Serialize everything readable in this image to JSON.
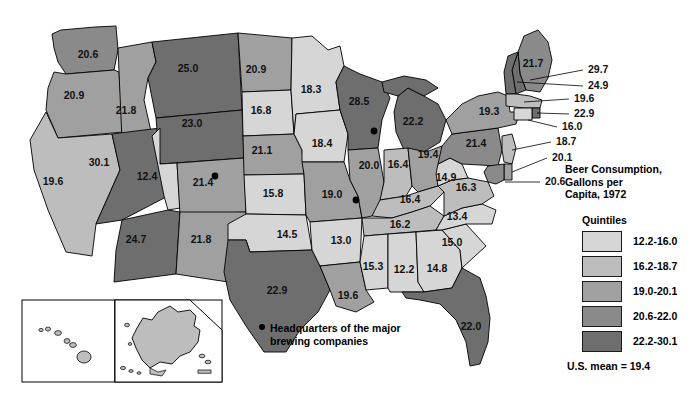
{
  "legend": {
    "title": "Beer Consumption,\nGallons per\nCapita, 1972",
    "quintiles_label": "Quintiles",
    "classes": [
      {
        "range": "12.2-16.0",
        "color": "#d6d6d6"
      },
      {
        "range": "16.2-18.7",
        "color": "#bdbdbd"
      },
      {
        "range": "19.0-20.1",
        "color": "#a0a0a0"
      },
      {
        "range": "20.6-22.0",
        "color": "#8a8a8a"
      },
      {
        "range": "22.2-30.1",
        "color": "#6e6e6e"
      }
    ],
    "mean_note": "U.S. mean = 19.4"
  },
  "hq_note": {
    "line1": "Headquarters of the major",
    "line2": "brewing companies"
  },
  "chart_data": {
    "type": "map",
    "title": "Beer Consumption, Gallons per Capita, 1972",
    "unit": "gallons per capita",
    "year": 1972,
    "us_mean": 19.4,
    "classification": "quintiles",
    "bins": [
      "12.2-16.0",
      "16.2-18.7",
      "19.0-20.1",
      "20.6-22.0",
      "22.2-30.1"
    ],
    "bin_colors": [
      "#d6d6d6",
      "#bdbdbd",
      "#a0a0a0",
      "#8a8a8a",
      "#6e6e6e"
    ],
    "values": [
      {
        "state": "Washington",
        "value": 20.6,
        "bin": 3,
        "label_x": 88,
        "label_y": 58
      },
      {
        "state": "Oregon",
        "value": 20.9,
        "bin": 3,
        "label_x": 74,
        "label_y": 99
      },
      {
        "state": "California",
        "value": 19.6,
        "bin": 2,
        "label_x": 53,
        "label_y": 185
      },
      {
        "state": "Idaho",
        "value": 21.8,
        "bin": 3,
        "label_x": 126,
        "label_y": 114
      },
      {
        "state": "Nevada",
        "value": 30.1,
        "bin": 4,
        "label_x": 99,
        "label_y": 166
      },
      {
        "state": "Montana",
        "value": 25.0,
        "bin": 4,
        "label_x": 188,
        "label_y": 72
      },
      {
        "state": "Wyoming",
        "value": 23.0,
        "bin": 4,
        "label_x": 192,
        "label_y": 127
      },
      {
        "state": "Utah",
        "value": 12.4,
        "bin": 0,
        "label_x": 147,
        "label_y": 180
      },
      {
        "state": "Colorado",
        "value": 21.4,
        "bin": 3,
        "label_x": 203,
        "label_y": 186
      },
      {
        "state": "Arizona",
        "value": 24.7,
        "bin": 4,
        "label_x": 136,
        "label_y": 243
      },
      {
        "state": "New Mexico",
        "value": 21.8,
        "bin": 3,
        "label_x": 201,
        "label_y": 243
      },
      {
        "state": "North Dakota",
        "value": 20.9,
        "bin": 3,
        "label_x": 256,
        "label_y": 73
      },
      {
        "state": "South Dakota",
        "value": 16.8,
        "bin": 1,
        "label_x": 261,
        "label_y": 114
      },
      {
        "state": "Nebraska",
        "value": 21.1,
        "bin": 3,
        "label_x": 262,
        "label_y": 154
      },
      {
        "state": "Kansas",
        "value": 15.8,
        "bin": 0,
        "label_x": 273,
        "label_y": 197
      },
      {
        "state": "Oklahoma",
        "value": 14.5,
        "bin": 0,
        "label_x": 287,
        "label_y": 238
      },
      {
        "state": "Texas",
        "value": 22.9,
        "bin": 4,
        "label_x": 277,
        "label_y": 294
      },
      {
        "state": "Minnesota",
        "value": 18.3,
        "bin": 1,
        "label_x": 311,
        "label_y": 93
      },
      {
        "state": "Iowa",
        "value": 18.4,
        "bin": 1,
        "label_x": 322,
        "label_y": 147
      },
      {
        "state": "Missouri",
        "value": 19.0,
        "bin": 2,
        "label_x": 332,
        "label_y": 198
      },
      {
        "state": "Arkansas",
        "value": 13.0,
        "bin": 0,
        "label_x": 341,
        "label_y": 244
      },
      {
        "state": "Louisiana",
        "value": 19.6,
        "bin": 2,
        "label_x": 348,
        "label_y": 299
      },
      {
        "state": "Wisconsin",
        "value": 28.5,
        "bin": 4,
        "label_x": 359,
        "label_y": 105
      },
      {
        "state": "Illinois",
        "value": 20.0,
        "bin": 2,
        "label_x": 369,
        "label_y": 169
      },
      {
        "state": "Michigan",
        "value": 22.2,
        "bin": 4,
        "label_x": 413,
        "label_y": 125
      },
      {
        "state": "Indiana",
        "value": 16.4,
        "bin": 1,
        "label_x": 398,
        "label_y": 168
      },
      {
        "state": "Ohio",
        "value": 19.4,
        "bin": 2,
        "label_x": 428,
        "label_y": 158
      },
      {
        "state": "Kentucky",
        "value": 16.4,
        "bin": 1,
        "label_x": 410,
        "label_y": 203
      },
      {
        "state": "Tennessee",
        "value": 16.2,
        "bin": 1,
        "label_x": 400,
        "label_y": 228
      },
      {
        "state": "Mississippi",
        "value": 15.3,
        "bin": 0,
        "label_x": 373,
        "label_y": 270
      },
      {
        "state": "Alabama",
        "value": 12.2,
        "bin": 0,
        "label_x": 404,
        "label_y": 273
      },
      {
        "state": "Georgia",
        "value": 14.8,
        "bin": 0,
        "label_x": 437,
        "label_y": 272
      },
      {
        "state": "Florida",
        "value": 22.0,
        "bin": 4,
        "label_x": 471,
        "label_y": 330
      },
      {
        "state": "South Carolina",
        "value": 15.0,
        "bin": 0,
        "label_x": 452,
        "label_y": 246
      },
      {
        "state": "North Carolina",
        "value": 13.4,
        "bin": 0,
        "label_x": 457,
        "label_y": 220
      },
      {
        "state": "Virginia",
        "value": 16.3,
        "bin": 1,
        "label_x": 466,
        "label_y": 191
      },
      {
        "state": "West Virginia",
        "value": 14.9,
        "bin": 0,
        "label_x": 446,
        "label_y": 181
      },
      {
        "state": "Pennsylvania",
        "value": 21.4,
        "bin": 3,
        "label_x": 476,
        "label_y": 147
      },
      {
        "state": "New York",
        "value": 19.3,
        "bin": 2,
        "label_x": 489,
        "label_y": 115
      },
      {
        "state": "Maine",
        "value": 21.7,
        "bin": 3,
        "label_x": 533,
        "label_y": 67
      },
      {
        "state": "Vermont",
        "value": 29.7,
        "bin": 4,
        "callout": true
      },
      {
        "state": "New Hampshire",
        "value": 24.9,
        "bin": 4,
        "callout": true
      },
      {
        "state": "Massachusetts",
        "value": 19.6,
        "bin": 2,
        "callout": true
      },
      {
        "state": "Rhode Island",
        "value": 22.9,
        "bin": 4,
        "callout": true
      },
      {
        "state": "Connecticut",
        "value": 16.0,
        "bin": 0,
        "callout": true
      },
      {
        "state": "New Jersey",
        "value": 18.7,
        "bin": 1,
        "callout": true
      },
      {
        "state": "Delaware",
        "value": 20.1,
        "bin": 2,
        "callout": true
      },
      {
        "state": "Maryland",
        "value": 20.6,
        "bin": 3,
        "callout": true
      },
      {
        "state": "Hawaii",
        "value": 17.4,
        "bin": 1,
        "label_x": 76,
        "label_y": 330
      },
      {
        "state": "Alaska",
        "value": 18.6,
        "bin": 1,
        "label_x": 160,
        "label_y": 332
      }
    ],
    "callouts": [
      {
        "state": "Vermont",
        "value": "29.7",
        "x": 588,
        "y": 73
      },
      {
        "state": "New Hampshire",
        "value": "24.9",
        "x": 588,
        "y": 89
      },
      {
        "state": "Massachusetts",
        "value": "19.6",
        "x": 574,
        "y": 102
      },
      {
        "state": "Rhode Island",
        "value": "22.9",
        "x": 574,
        "y": 117
      },
      {
        "state": "Connecticut",
        "value": "16.0",
        "x": 562,
        "y": 130
      },
      {
        "state": "New Jersey",
        "value": "18.7",
        "x": 556,
        "y": 145
      },
      {
        "state": "Delaware",
        "value": "20.1",
        "x": 552,
        "y": 161
      },
      {
        "state": "Maryland",
        "value": "20.6",
        "x": 545,
        "y": 185
      }
    ],
    "hq_dots": [
      {
        "city": "Denver",
        "x": 215,
        "y": 176
      },
      {
        "city": "Milwaukee",
        "x": 374,
        "y": 131
      },
      {
        "city": "St. Louis",
        "x": 356,
        "y": 200
      }
    ]
  }
}
